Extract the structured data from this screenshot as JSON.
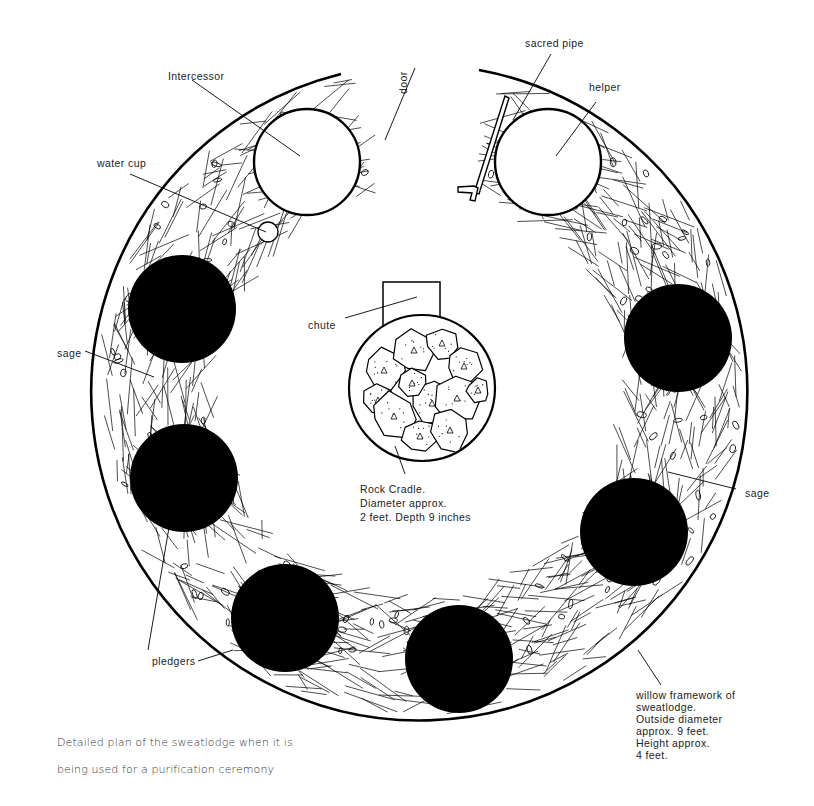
{
  "figure": {
    "title_lines": [
      "Detailed plan of the sweatlodge when it is",
      "being used for a purification ceremony"
    ]
  },
  "labels": {
    "intercessor": "Intercessor",
    "water_cup": "water cup",
    "door": "door",
    "sacred_pipe": "sacred pipe",
    "helper": "helper",
    "chute": "chute",
    "sage_left": "sage",
    "sage_right": "sage",
    "pledgers": "pledgers",
    "rock_cradle": "Rock Cradle.\nDiameter approx.\n2 feet. Depth 9 inches",
    "willow_framework": "willow framework of\nsweatlodge.\nOutside diameter\napprox. 9 feet.\nHeight approx.\n4 feet."
  },
  "colors": {
    "ink": "#000000",
    "paper": "#ffffff",
    "text": "#222222"
  },
  "geometry": {
    "lodge": {
      "cx": 421,
      "cy": 392,
      "r": 328
    },
    "open_seats": [
      {
        "role": "intercessor",
        "cx": 307,
        "cy": 162,
        "r": 53
      },
      {
        "role": "helper",
        "cx": 548,
        "cy": 162,
        "r": 53
      }
    ],
    "water_cup": {
      "cx": 268,
      "cy": 232,
      "r": 10
    },
    "pledger_seats": [
      {
        "cx": 182,
        "cy": 309,
        "r": 54
      },
      {
        "cx": 184,
        "cy": 478,
        "r": 54
      },
      {
        "cx": 285,
        "cy": 618,
        "r": 54
      },
      {
        "cx": 459,
        "cy": 659,
        "r": 54
      },
      {
        "cx": 634,
        "cy": 532,
        "r": 54
      },
      {
        "cx": 678,
        "cy": 338,
        "r": 54
      }
    ],
    "rock_cradle": {
      "cx": 422,
      "cy": 388,
      "r": 73
    },
    "chute": {
      "x": 383,
      "y": 282,
      "w": 57,
      "h": 48
    }
  }
}
